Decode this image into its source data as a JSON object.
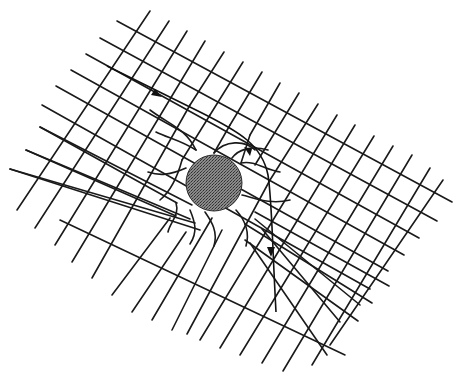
{
  "diagram": {
    "labels": [],
    "colors": {
      "background": "#ffffff",
      "grid_line": "#1a1a1a",
      "mass_fill": "#6b6b6b",
      "trajectory": "#111111"
    },
    "mass": {
      "cx": 214,
      "cy": 183,
      "r": 28
    },
    "trajectory": {
      "start": [
        107,
        66
      ],
      "arrowheads": [
        [
          158,
          95
        ],
        [
          271,
          253
        ]
      ],
      "end": [
        276,
        312
      ]
    }
  }
}
